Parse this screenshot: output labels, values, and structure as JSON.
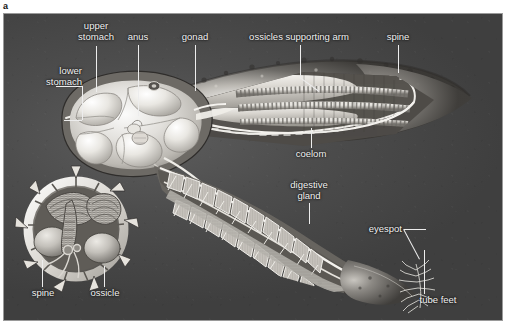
{
  "figure": {
    "panel_letter": "a",
    "style": "grayscale airbrush scientific illustration",
    "background_color": "#4a4a4a",
    "label_color": "#f2f2f2",
    "leader_color": "#ededed",
    "frame_border_color": "#9a9a9a"
  },
  "labels": {
    "upper_stomach": "upper\nstomach",
    "lower_stomach": "lower\nstomach",
    "anus": "anus",
    "gonad": "gonad",
    "ossicles_supporting_arm": "ossicles supporting arm",
    "spine_top": "spine",
    "coelom": "coelom",
    "digestive_gland": "digestive\ngland",
    "eyespot": "eyespot",
    "tube_feet": "tube feet",
    "spine_inset": "spine",
    "ossicle_inset": "ossicle"
  },
  "structures": [
    {
      "name": "central disc",
      "region": "upper-left",
      "contains": [
        "upper stomach",
        "lower stomach",
        "anus"
      ]
    },
    {
      "name": "upper arm cutaway",
      "region": "upper-right",
      "contains": [
        "gonad",
        "ossicles supporting arm",
        "coelom",
        "spine"
      ]
    },
    {
      "name": "lower arm cutaway",
      "region": "lower-right",
      "contains": [
        "digestive gland",
        "eyespot",
        "tube feet"
      ]
    },
    {
      "name": "arm cross-section inset",
      "region": "lower-left",
      "contains": [
        "spine",
        "ossicle"
      ]
    }
  ]
}
